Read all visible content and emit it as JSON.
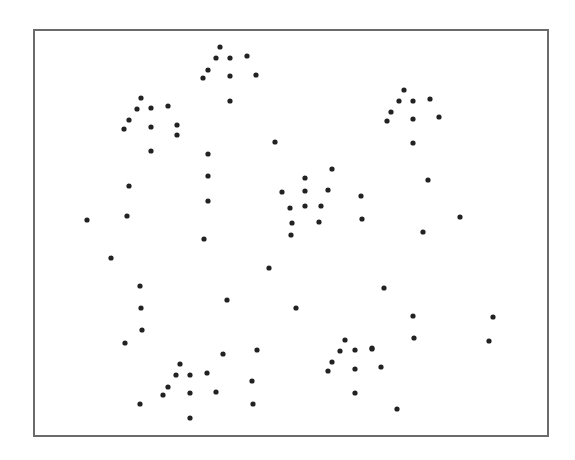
{
  "chart_data": {
    "type": "scatter",
    "title": "",
    "xlabel": "",
    "ylabel": "",
    "axes_visible": false,
    "grid": false,
    "legend": null,
    "frame": {
      "x0": 33,
      "y0": 29,
      "x1": 547,
      "y1": 435
    },
    "marker": {
      "shape": "circle",
      "radius": 2.6,
      "color": "#222222"
    },
    "coordinate_space": "pixel",
    "points": [
      [
        220,
        47
      ],
      [
        216,
        58
      ],
      [
        230,
        58
      ],
      [
        247,
        56
      ],
      [
        208,
        70
      ],
      [
        203,
        78
      ],
      [
        230,
        76
      ],
      [
        256,
        75
      ],
      [
        230,
        101
      ],
      [
        141,
        98
      ],
      [
        137,
        109
      ],
      [
        151,
        108
      ],
      [
        168,
        106
      ],
      [
        129,
        120
      ],
      [
        124,
        129
      ],
      [
        151,
        127
      ],
      [
        177,
        125
      ],
      [
        177,
        135
      ],
      [
        151,
        151
      ],
      [
        404,
        90
      ],
      [
        399,
        101
      ],
      [
        413,
        101
      ],
      [
        430,
        99
      ],
      [
        391,
        112
      ],
      [
        387,
        121
      ],
      [
        413,
        119
      ],
      [
        439,
        117
      ],
      [
        413,
        143
      ],
      [
        332,
        169
      ],
      [
        305,
        178
      ],
      [
        282,
        192
      ],
      [
        305,
        191
      ],
      [
        328,
        190
      ],
      [
        361,
        196
      ],
      [
        290,
        208
      ],
      [
        305,
        206
      ],
      [
        321,
        206
      ],
      [
        292,
        223
      ],
      [
        319,
        222
      ],
      [
        362,
        219
      ],
      [
        291,
        235
      ],
      [
        223,
        354
      ],
      [
        257,
        350
      ],
      [
        180,
        364
      ],
      [
        176,
        375
      ],
      [
        190,
        375
      ],
      [
        207,
        373
      ],
      [
        252,
        381
      ],
      [
        168,
        387
      ],
      [
        163,
        395
      ],
      [
        190,
        393
      ],
      [
        216,
        392
      ],
      [
        253,
        404
      ],
      [
        190,
        418
      ],
      [
        140,
        404
      ],
      [
        345,
        340
      ],
      [
        340,
        351
      ],
      [
        355,
        350
      ],
      [
        372,
        349
      ],
      [
        332,
        362
      ],
      [
        328,
        371
      ],
      [
        355,
        369
      ],
      [
        381,
        367
      ],
      [
        355,
        393
      ],
      [
        397,
        409
      ],
      [
        129,
        186
      ],
      [
        208,
        154
      ],
      [
        208,
        176
      ],
      [
        208,
        201
      ],
      [
        87,
        220
      ],
      [
        127,
        216
      ],
      [
        204,
        239
      ],
      [
        111,
        258
      ],
      [
        140,
        286
      ],
      [
        141,
        308
      ],
      [
        142,
        330
      ],
      [
        125,
        343
      ],
      [
        227,
        300
      ],
      [
        275,
        142
      ],
      [
        269,
        268
      ],
      [
        296,
        308
      ],
      [
        428,
        180
      ],
      [
        460,
        217
      ],
      [
        423,
        232
      ],
      [
        384,
        288
      ],
      [
        413,
        316
      ],
      [
        414,
        338
      ],
      [
        493,
        317
      ],
      [
        489,
        341
      ],
      [
        372,
        348
      ]
    ]
  }
}
